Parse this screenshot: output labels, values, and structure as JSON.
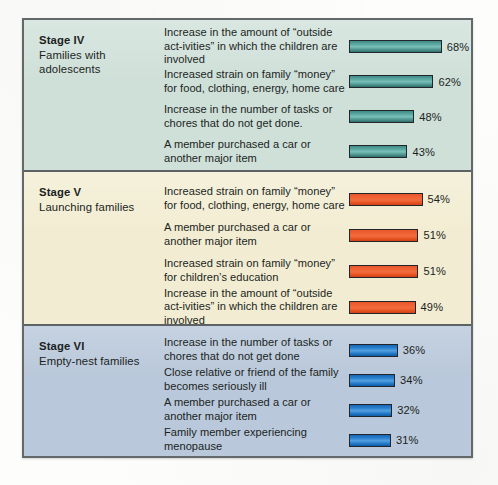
{
  "panel": {
    "border_color": "#63686b",
    "background_color": "#dfe6e4"
  },
  "stages": [
    {
      "name": "Stage IV",
      "description": "Families with adolescents",
      "background_color": "#cfe0d9",
      "bar_color": "#4e948f",
      "items": [
        {
          "label": "Increase in the amount of “outside act-ivities” in which the children are involved",
          "value": 68,
          "value_label": "68%"
        },
        {
          "label": "Increased strain on family “money” for food, clothing, energy, home care",
          "value": 62,
          "value_label": "62%"
        },
        {
          "label": "Increase in the number of tasks or chores that do not get done.",
          "value": 48,
          "value_label": "48%"
        },
        {
          "label": "A member purchased a car or another major item",
          "value": 43,
          "value_label": "43%"
        }
      ]
    },
    {
      "name": "Stage V",
      "description": "Launching families",
      "background_color": "#f2edd2",
      "bar_color": "#ef6235",
      "items": [
        {
          "label": "Increased strain on family “money” for food, clothing, energy, home care",
          "value": 54,
          "value_label": "54%"
        },
        {
          "label": "A member purchased a car or another major item",
          "value": 51,
          "value_label": "51%"
        },
        {
          "label": "Increased strain on family “money” for children’s education",
          "value": 51,
          "value_label": "51%"
        },
        {
          "label": "Increase in the amount of “outside act-ivities” in which the children are involved",
          "value": 49,
          "value_label": "49%"
        }
      ]
    },
    {
      "name": "Stage VI",
      "description": "Empty-nest families",
      "background_color": "#b9c8da",
      "bar_color": "#2a81cf",
      "items": [
        {
          "label": "Increase in the number of tasks or chores that do not get done",
          "value": 36,
          "value_label": "36%"
        },
        {
          "label": "Close relative or friend of the family becomes seriously ill",
          "value": 34,
          "value_label": "34%"
        },
        {
          "label": "A member purchased a car or another major item",
          "value": 32,
          "value_label": "32%"
        },
        {
          "label": "Family member experiencing menopause",
          "value": 31,
          "value_label": "31%"
        }
      ]
    }
  ],
  "chart_data": {
    "type": "bar",
    "title": "",
    "xlabel": "",
    "ylabel": "",
    "orientation": "horizontal",
    "value_unit": "percent",
    "xlim": [
      0,
      100
    ],
    "grid": false,
    "legend": "none",
    "groups": [
      {
        "group": "Stage IV — Families with adolescents",
        "color": "#4e948f",
        "categories": [
          "Increase in the amount of “outside activities” in which the children are involved",
          "Increased strain on family “money” for food, clothing, energy, home care",
          "Increase in the number of tasks or chores that do not get done.",
          "A member purchased a car or another major item"
        ],
        "values": [
          68,
          62,
          48,
          43
        ]
      },
      {
        "group": "Stage V — Launching families",
        "color": "#ef6235",
        "categories": [
          "Increased strain on family “money” for food, clothing, energy, home care",
          "A member purchased a car or another major item",
          "Increased strain on family “money” for children’s education",
          "Increase in the amount of “outside activities” in which the children are involved"
        ],
        "values": [
          54,
          51,
          51,
          49
        ]
      },
      {
        "group": "Stage VI — Empty-nest families",
        "color": "#2a81cf",
        "categories": [
          "Increase in the number of tasks or chores that do not get done",
          "Close relative or friend of the family becomes seriously ill",
          "A member purchased a car or another major item",
          "Family member experiencing menopause"
        ],
        "values": [
          36,
          34,
          32,
          31
        ]
      }
    ]
  }
}
